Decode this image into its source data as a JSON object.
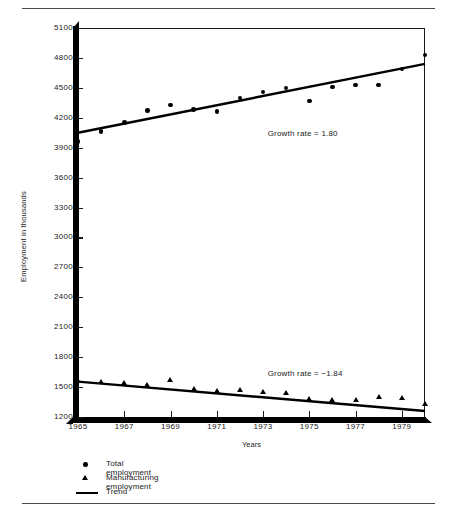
{
  "page": {
    "title": "",
    "figure_name": "employment-trend-chart"
  },
  "legend": {
    "items": [
      {
        "marker": "circle-marker",
        "label": "Total employment"
      },
      {
        "marker": "triangle-marker",
        "label": "Manufacturing employment"
      },
      {
        "marker": "line-marker",
        "label": "Trend"
      }
    ]
  },
  "annotations": {
    "upper": "Growth rate  =  1.80",
    "lower": "Growth rate  =  −1.84"
  },
  "chart_data": {
    "type": "scatter",
    "title": "",
    "xlabel": "Years",
    "ylabel": "Employment in thousands",
    "xlim": [
      1965,
      1980
    ],
    "ylim": [
      1200,
      5100
    ],
    "xticks": [
      1965,
      1967,
      1969,
      1971,
      1973,
      1975,
      1977,
      1979
    ],
    "yticks": [
      1200,
      1500,
      1800,
      2100,
      2400,
      2700,
      3000,
      3300,
      3600,
      3900,
      4200,
      4500,
      4800,
      5100
    ],
    "grid": false,
    "legend_position": "below-axes-left",
    "x": [
      1965,
      1966,
      1967,
      1968,
      1969,
      1970,
      1971,
      1972,
      1973,
      1974,
      1975,
      1976,
      1977,
      1978,
      1979,
      1980
    ],
    "series": [
      {
        "name": "Total employment",
        "marker": "circle",
        "values": [
          3960,
          4060,
          4150,
          4270,
          4330,
          4280,
          4260,
          4400,
          4460,
          4500,
          4370,
          4510,
          4530,
          4530,
          4690,
          4830
        ],
        "trend": {
          "name": "Trend",
          "growth_rate": 1.8,
          "y_start": 4050,
          "y_end": 4740
        }
      },
      {
        "name": "Manufacturing employment",
        "marker": "triangle",
        "values": [
          1560,
          1550,
          1540,
          1520,
          1570,
          1480,
          1460,
          1470,
          1450,
          1440,
          1380,
          1370,
          1370,
          1400,
          1390,
          1330
        ],
        "trend": {
          "name": "Trend",
          "growth_rate": -1.84,
          "y_start": 1555,
          "y_end": 1260
        }
      }
    ]
  }
}
